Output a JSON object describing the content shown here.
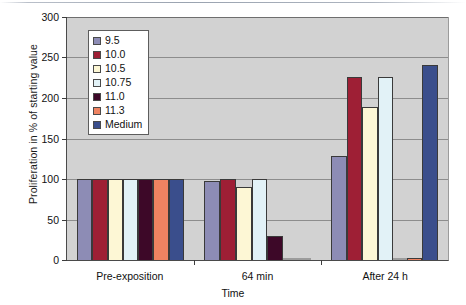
{
  "chart_data": {
    "type": "bar",
    "title": "",
    "xlabel": "Time",
    "ylabel": "Proliferation in % of starting value",
    "ylim": [
      0,
      300
    ],
    "yticks": [
      0,
      50,
      100,
      150,
      200,
      250,
      300
    ],
    "ytick_labels": [
      "0",
      "50",
      "100",
      "150",
      "200",
      "250",
      "300"
    ],
    "grid": true,
    "legend_position": "upper-left-inside",
    "categories": [
      "Pre-exposition",
      "64 min",
      "After 24 h"
    ],
    "series": [
      {
        "name": "9.5",
        "color": "#8d8cb5",
        "values": [
          100,
          97,
          128
        ]
      },
      {
        "name": "10.0",
        "color": "#9e1f35",
        "values": [
          100,
          100,
          225
        ]
      },
      {
        "name": "10.5",
        "color": "#fdf7d5",
        "values": [
          100,
          90,
          188
        ]
      },
      {
        "name": "10.75",
        "color": "#e2f2f7",
        "values": [
          100,
          100,
          225
        ]
      },
      {
        "name": "11.0",
        "color": "#3d0828",
        "values": [
          100,
          30,
          0
        ]
      },
      {
        "name": "11.3",
        "color": "#ef8361",
        "values": [
          100,
          1,
          3
        ]
      },
      {
        "name": "Medium",
        "color": "#3a4e8c",
        "values": [
          100,
          0,
          240
        ]
      }
    ]
  },
  "axis": {
    "y_title": "Proliferation in % of starting value",
    "x_title": "Time"
  }
}
